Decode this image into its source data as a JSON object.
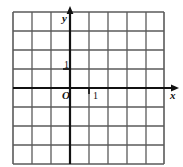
{
  "figure": {
    "kind": "cartesian-coordinate-grid",
    "background_color": "#ffffff",
    "grid": {
      "columns": 8,
      "rows": 8,
      "cell_size_px": 19,
      "left_px": 13,
      "top_px": 12,
      "line_color": "#5a5a5a",
      "border_color": "#4a4a4a"
    },
    "axes": {
      "color": "#111111",
      "x_axis_row_index": 4,
      "y_axis_column_index": 3,
      "x_axis_y_px": 88,
      "y_axis_x_px": 70,
      "x_arrow_end_px": 179,
      "y_arrow_end_px": 6
    }
  },
  "labels": {
    "y_axis": "y",
    "x_axis": "x",
    "origin": "O",
    "tick_y_one": "1",
    "tick_x_one": "1"
  },
  "ticks": {
    "x": [
      {
        "value": 1,
        "label": "1",
        "x_px": 89,
        "y_px": 88
      }
    ],
    "y": [
      {
        "value": 1,
        "label": "1",
        "x_px": 70,
        "y_px": 69
      }
    ]
  }
}
